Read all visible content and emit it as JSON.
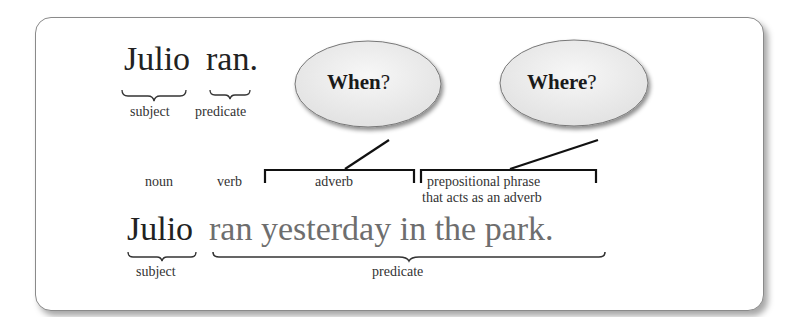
{
  "example1": {
    "subject_word": "Julio",
    "predicate_word": "ran.",
    "subject_label": "subject",
    "predicate_label": "predicate"
  },
  "bubbles": [
    {
      "word": "When",
      "mark": "?"
    },
    {
      "word": "Where",
      "mark": "?"
    }
  ],
  "parts_of_speech": {
    "noun": "noun",
    "verb": "verb",
    "adverb": "adverb",
    "prep_line1": "prepositional phrase",
    "prep_line2": "that acts as an adverb"
  },
  "example2": {
    "subject_word": "Julio",
    "predicate_text": "ran yesterday in the park.",
    "subject_label": "subject",
    "predicate_label": "predicate"
  },
  "colors": {
    "text": "#222222",
    "predicate_gray": "#6e6e6e",
    "frame_border": "#8a8a8a",
    "bubble_fill": "#ececec"
  }
}
